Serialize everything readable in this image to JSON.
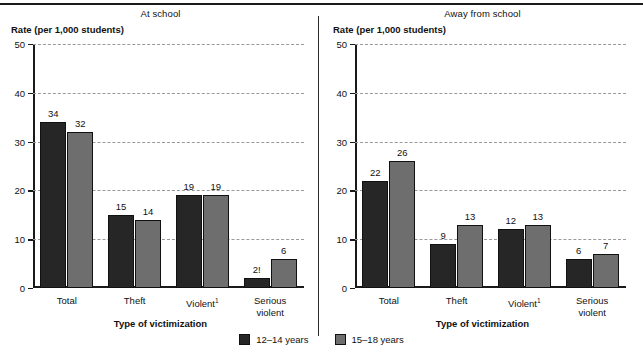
{
  "chart_data": {
    "type": "bar",
    "ylabel": "Rate (per 1,000 students)",
    "xlabel": "Type of victimization",
    "ylim": [
      0,
      50
    ],
    "yticks": [
      0,
      10,
      20,
      30,
      40,
      50
    ],
    "ytick_labels": [
      "0",
      "10",
      "20",
      "30",
      "40",
      "50"
    ],
    "grid": "horizontal-dashed",
    "legend_position": "bottom-center",
    "categories": [
      "Total",
      "Theft",
      "Violent",
      "Serious violent"
    ],
    "category_labels": [
      "Total",
      "Theft",
      "Violent¹",
      "Serious violent"
    ],
    "legend": [
      "12–14 years",
      "15–18 years"
    ],
    "panels": [
      {
        "title": "At school",
        "series": [
          {
            "name": "12–14 years",
            "color": "#262626",
            "values": [
              34,
              15,
              19,
              2
            ],
            "labels": [
              "34",
              "15",
              "19",
              "2!"
            ]
          },
          {
            "name": "15–18 years",
            "color": "#6e6e6e",
            "values": [
              32,
              14,
              19,
              6
            ],
            "labels": [
              "32",
              "14",
              "19",
              "6"
            ]
          }
        ]
      },
      {
        "title": "Away from school",
        "series": [
          {
            "name": "12–14 years",
            "color": "#262626",
            "values": [
              22,
              9,
              12,
              6
            ],
            "labels": [
              "22",
              "9",
              "12",
              "6"
            ]
          },
          {
            "name": "15–18 years",
            "color": "#6e6e6e",
            "values": [
              26,
              13,
              13,
              7
            ],
            "labels": [
              "26",
              "13",
              "13",
              "7"
            ]
          }
        ]
      }
    ]
  },
  "colors": {
    "series_a": "#262626",
    "series_b": "#6e6e6e",
    "axis": "#1a1a1a",
    "grid": "#9a9a9a",
    "text": "#111111",
    "background": "#ffffff"
  }
}
